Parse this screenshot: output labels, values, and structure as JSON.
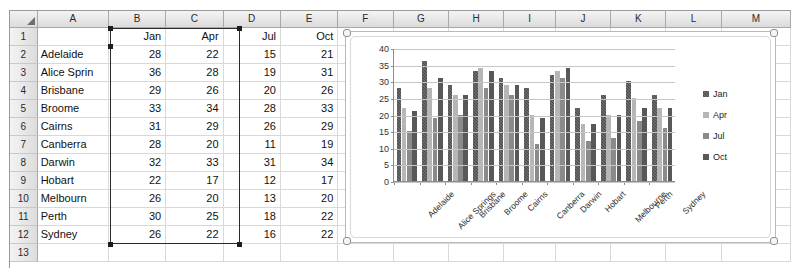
{
  "spreadsheet": {
    "column_headers": [
      "A",
      "B",
      "C",
      "D",
      "E",
      "F",
      "G",
      "H",
      "I",
      "J",
      "K",
      "L",
      "M"
    ],
    "row_numbers": [
      "1",
      "2",
      "3",
      "4",
      "5",
      "6",
      "7",
      "8",
      "9",
      "10",
      "11",
      "12",
      "13"
    ],
    "header_row": {
      "a": "",
      "b": "Jan",
      "c": "Apr",
      "d": "Jul",
      "e": "Oct"
    },
    "rows": [
      {
        "name": "Adelaide",
        "jan": "28",
        "apr": "22",
        "jul": "15",
        "oct": "21"
      },
      {
        "name": "Alice Sprin",
        "jan": "36",
        "apr": "28",
        "jul": "19",
        "oct": "31"
      },
      {
        "name": "Brisbane",
        "jan": "29",
        "apr": "26",
        "jul": "20",
        "oct": "26"
      },
      {
        "name": "Broome",
        "jan": "33",
        "apr": "34",
        "jul": "28",
        "oct": "33"
      },
      {
        "name": "Cairns",
        "jan": "31",
        "apr": "29",
        "jul": "26",
        "oct": "29"
      },
      {
        "name": "Canberra",
        "jan": "28",
        "apr": "20",
        "jul": "11",
        "oct": "19"
      },
      {
        "name": "Darwin",
        "jan": "32",
        "apr": "33",
        "jul": "31",
        "oct": "34"
      },
      {
        "name": "Hobart",
        "jan": "22",
        "apr": "17",
        "jul": "12",
        "oct": "17"
      },
      {
        "name": "Melbourn",
        "jan": "26",
        "apr": "20",
        "jul": "13",
        "oct": "20"
      },
      {
        "name": "Perth",
        "jan": "30",
        "apr": "25",
        "jul": "18",
        "oct": "22"
      },
      {
        "name": "Sydney",
        "jan": "26",
        "apr": "22",
        "jul": "16",
        "oct": "22"
      }
    ]
  },
  "chart_data": {
    "type": "bar",
    "title": "",
    "xlabel": "",
    "ylabel": "",
    "ylim": [
      0,
      40
    ],
    "yticks": [
      0,
      5,
      10,
      15,
      20,
      25,
      30,
      35,
      40
    ],
    "grid": true,
    "legend_position": "right",
    "categories": [
      "Adelaide",
      "Alice Springs",
      "Brisbane",
      "Broome",
      "Cairns",
      "Canberra",
      "Darwin",
      "Hobart",
      "Melbourne",
      "Perth",
      "Sydney"
    ],
    "series": [
      {
        "name": "Jan",
        "color": "#4b4b4b",
        "values": [
          28,
          36,
          29,
          33,
          31,
          28,
          32,
          22,
          26,
          30,
          26
        ]
      },
      {
        "name": "Apr",
        "color": "#b6b6b6",
        "values": [
          22,
          28,
          26,
          34,
          29,
          20,
          33,
          17,
          20,
          25,
          22
        ]
      },
      {
        "name": "Jul",
        "color": "#8a8a8a",
        "values": [
          15,
          19,
          20,
          28,
          26,
          11,
          31,
          12,
          13,
          18,
          16
        ]
      },
      {
        "name": "Oct",
        "color": "#585858",
        "values": [
          21,
          31,
          26,
          33,
          29,
          19,
          34,
          17,
          20,
          22,
          22
        ]
      }
    ]
  }
}
